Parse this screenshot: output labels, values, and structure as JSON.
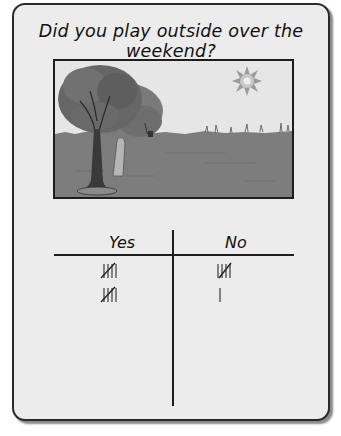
{
  "worksheet": {
    "title": "Did you play outside over the weekend?",
    "picture": {
      "description": "Grayscale illustration of trees on a grassy field under a sky with a bright sun",
      "icons": [
        "tree-icon",
        "sun-icon",
        "grass-field"
      ]
    },
    "tally_chart": {
      "columns": [
        {
          "label": "Yes",
          "tally_rows": [
            5,
            5
          ],
          "total": 10
        },
        {
          "label": "No",
          "tally_rows": [
            5,
            1
          ],
          "total": 6
        }
      ]
    }
  },
  "colors": {
    "card_background": "#ececec",
    "border": "#2a2a2a",
    "ink": "#111111",
    "tally_ink": "#555555"
  }
}
